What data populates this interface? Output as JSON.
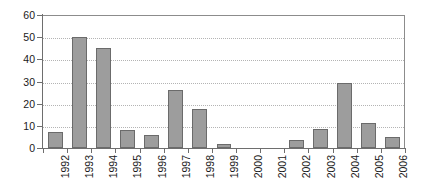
{
  "chart_data": {
    "type": "bar",
    "title": "",
    "subtitle": "",
    "xlabel": "",
    "ylabel": "",
    "categories": [
      "1992",
      "1993",
      "1994",
      "1995",
      "1996",
      "1997",
      "1998",
      "1999",
      "2000",
      "2001",
      "2002",
      "2003",
      "2004",
      "2005",
      "2006"
    ],
    "values": [
      7,
      50,
      45,
      8,
      6,
      26,
      17.5,
      2,
      0,
      0,
      3.5,
      8.5,
      29.5,
      11.5,
      5
    ],
    "series": [
      {
        "name": "",
        "values": [
          7,
          50,
          45,
          8,
          6,
          26,
          17.5,
          2,
          0,
          0,
          3.5,
          8.5,
          29.5,
          11.5,
          5
        ]
      }
    ],
    "ylim": [
      0,
      60
    ],
    "ytick_labels": [
      "0",
      "10",
      "20",
      "30",
      "40",
      "50",
      "60"
    ],
    "ytick_values": [
      0,
      10,
      20,
      30,
      40,
      50,
      60
    ],
    "xtick_labels": [
      "1992",
      "1993",
      "1994",
      "1995",
      "1996",
      "1997",
      "1998",
      "1999",
      "2000",
      "2001",
      "2002",
      "2003",
      "2004",
      "2005",
      "2006"
    ],
    "grid": true,
    "grid_axis": "y",
    "grid_style": "dotted",
    "legend": false,
    "legend_position": "none",
    "xlabel_rotation": 90,
    "bar_color": "#9d9d9d",
    "bar_border_color": "#6b6b6b",
    "gridline_color": "#b4b4b4",
    "axis_color": "#6e6e6e",
    "background_color": "#ffffff",
    "annotations": []
  }
}
